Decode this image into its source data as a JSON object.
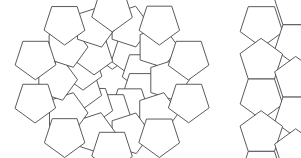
{
  "page": {
    "background_color": "#ffffff",
    "width": 301,
    "height": 158
  },
  "style": {
    "stroke_color": "#484848",
    "fill_color": "#ffffff",
    "stroke_width": 0.9
  },
  "figures": [
    {
      "id": "pentagon-rosette",
      "name": "pentagonal-rosette",
      "description": "Ten-fold pentagonal rosette formed from regular pentagons arranged in concentric rings around a central decagonal void",
      "center": [
        112,
        80
      ],
      "bounds": {
        "x": 12,
        "y": 6,
        "width": 200,
        "height": 146
      },
      "symmetry": "10-fold",
      "pentagon_count": 30,
      "rings": [
        {
          "name": "inner-ring",
          "count": 10,
          "radius": 28
        },
        {
          "name": "middle-ring",
          "count": 10,
          "radius": 52
        },
        {
          "name": "outer-ring",
          "count": 10,
          "radius": 72
        }
      ]
    },
    {
      "id": "pentagon-column",
      "name": "pentagon-column-cropped",
      "description": "Vertical column of stacked pentagons, cropped at the right edge of the image",
      "center": [
        296,
        79
      ],
      "bounds": {
        "x": 252,
        "y": 10,
        "width": 49,
        "height": 138
      },
      "pentagon_count": 6,
      "cropped": true
    }
  ],
  "geometry": {
    "rosette_side_length": 25,
    "rosette_rotation_deg": 0,
    "pentagon_interior_angle_deg": 108
  }
}
